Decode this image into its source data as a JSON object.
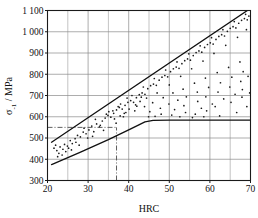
{
  "chart_data": {
    "type": "scatter",
    "title": "",
    "subtitle": "",
    "xlabel": "HRC",
    "ylabel": "σ₋₁ / MPa",
    "ylabel_parts": {
      "symbol": "σ",
      "subscript": "-1",
      "separator": " / ",
      "unit": "MPa"
    },
    "xlim": [
      20,
      70
    ],
    "ylim": [
      300,
      1100
    ],
    "grid": true,
    "grid_major_x": [
      20,
      30,
      40,
      50,
      60,
      70
    ],
    "grid_minor_x": [
      25,
      35,
      45,
      55,
      65
    ],
    "grid_major_y": [
      300,
      400,
      500,
      600,
      700,
      800,
      900,
      1000,
      1100
    ],
    "legend": null,
    "legend_position": "none",
    "xticks": [
      20,
      30,
      40,
      50,
      60,
      70
    ],
    "xtick_labels": [
      "20",
      "30",
      "40",
      "50",
      "60",
      "70"
    ],
    "yticks": [
      300,
      400,
      500,
      600,
      700,
      800,
      900,
      1000,
      1100
    ],
    "ytick_labels": [
      "300",
      "400",
      "500",
      "600",
      "700",
      "800",
      "900",
      "1 000",
      "1 100"
    ],
    "series": [
      {
        "name": "upper-bound",
        "type": "line",
        "style": "solid",
        "color": "#111111",
        "points": [
          [
            21,
            480
          ],
          [
            70,
            1110
          ]
        ]
      },
      {
        "name": "lower-bound",
        "type": "line",
        "style": "solid",
        "color": "#111111",
        "points": [
          [
            21,
            375
          ],
          [
            28,
            432
          ],
          [
            35,
            492
          ],
          [
            40,
            538
          ],
          [
            42.5,
            562
          ],
          [
            44,
            576
          ],
          [
            46,
            583
          ],
          [
            50,
            584
          ],
          [
            60,
            584
          ],
          [
            70,
            584
          ]
        ]
      },
      {
        "name": "scatter-band",
        "type": "scatter",
        "color": "#1b1b1b",
        "marker": "dot",
        "points": [
          [
            21.6,
            452
          ],
          [
            22.3,
            441
          ],
          [
            22.0,
            466
          ],
          [
            23.1,
            458
          ],
          [
            23.8,
            447
          ],
          [
            22.8,
            428
          ],
          [
            24.2,
            470
          ],
          [
            24.9,
            462
          ],
          [
            25.6,
            488
          ],
          [
            26.1,
            474
          ],
          [
            26.8,
            497
          ],
          [
            24.5,
            436
          ],
          [
            25.2,
            452
          ],
          [
            27.4,
            512
          ],
          [
            28.1,
            505
          ],
          [
            27.0,
            480
          ],
          [
            28.8,
            528
          ],
          [
            29.5,
            520
          ],
          [
            29.0,
            546
          ],
          [
            30.2,
            538
          ],
          [
            30.9,
            556
          ],
          [
            31.4,
            530
          ],
          [
            32.1,
            566
          ],
          [
            32.8,
            552
          ],
          [
            31.8,
            588
          ],
          [
            33.5,
            580
          ],
          [
            34.2,
            594
          ],
          [
            33.0,
            560
          ],
          [
            34.9,
            606
          ],
          [
            35.6,
            598
          ],
          [
            35.1,
            624
          ],
          [
            36.3,
            616
          ],
          [
            37.0,
            632
          ],
          [
            36.5,
            590
          ],
          [
            37.7,
            644
          ],
          [
            38.4,
            636
          ],
          [
            38.0,
            660
          ],
          [
            39.1,
            654
          ],
          [
            39.8,
            668
          ],
          [
            39.3,
            620
          ],
          [
            40.5,
            676
          ],
          [
            41.2,
            668
          ],
          [
            40.8,
            700
          ],
          [
            41.9,
            690
          ],
          [
            42.6,
            704
          ],
          [
            42.0,
            650
          ],
          [
            43.3,
            712
          ],
          [
            44.0,
            706
          ],
          [
            43.6,
            740
          ],
          [
            44.7,
            732
          ],
          [
            45.4,
            746
          ],
          [
            44.4,
            688
          ],
          [
            46.1,
            754
          ],
          [
            46.8,
            748
          ],
          [
            46.3,
            780
          ],
          [
            47.5,
            772
          ],
          [
            48.2,
            786
          ],
          [
            47.0,
            712
          ],
          [
            48.9,
            794
          ],
          [
            49.6,
            788
          ],
          [
            49.1,
            820
          ],
          [
            50.3,
            812
          ],
          [
            51.0,
            826
          ],
          [
            50.0,
            750
          ],
          [
            51.7,
            834
          ],
          [
            52.4,
            828
          ],
          [
            51.9,
            858
          ],
          [
            53.1,
            850
          ],
          [
            53.8,
            864
          ],
          [
            52.8,
            790
          ],
          [
            54.5,
            872
          ],
          [
            55.2,
            866
          ],
          [
            54.8,
            896
          ],
          [
            55.9,
            888
          ],
          [
            56.6,
            902
          ],
          [
            55.5,
            826
          ],
          [
            57.3,
            910
          ],
          [
            58.0,
            904
          ],
          [
            57.6,
            934
          ],
          [
            58.7,
            926
          ],
          [
            59.4,
            940
          ],
          [
            58.3,
            862
          ],
          [
            60.1,
            948
          ],
          [
            60.8,
            942
          ],
          [
            60.4,
            972
          ],
          [
            61.5,
            964
          ],
          [
            62.2,
            978
          ],
          [
            61.0,
            898
          ],
          [
            62.9,
            986
          ],
          [
            63.6,
            980
          ],
          [
            63.2,
            1010
          ],
          [
            64.3,
            1002
          ],
          [
            65.0,
            1016
          ],
          [
            63.9,
            936
          ],
          [
            65.7,
            1024
          ],
          [
            66.4,
            1018
          ],
          [
            66.0,
            1048
          ],
          [
            67.1,
            1040
          ],
          [
            67.8,
            1054
          ],
          [
            66.8,
            974
          ],
          [
            68.5,
            1062
          ],
          [
            69.2,
            1056
          ],
          [
            68.8,
            1082
          ],
          [
            69.6,
            1074
          ],
          [
            69.0,
            1010
          ],
          [
            22.5,
            412
          ],
          [
            23.6,
            420
          ],
          [
            25.9,
            444
          ],
          [
            27.8,
            466
          ],
          [
            29.9,
            500
          ],
          [
            31.1,
            508
          ],
          [
            33.8,
            536
          ],
          [
            36.9,
            570
          ],
          [
            38.7,
            600
          ],
          [
            41.5,
            628
          ],
          [
            43.9,
            648
          ],
          [
            45.9,
            666
          ],
          [
            48.5,
            690
          ],
          [
            50.9,
            712
          ],
          [
            53.4,
            730
          ],
          [
            56.2,
            758
          ],
          [
            58.9,
            782
          ],
          [
            61.8,
            808
          ],
          [
            64.6,
            832
          ],
          [
            67.4,
            858
          ],
          [
            45.2,
            624
          ],
          [
            47.8,
            640
          ],
          [
            49.9,
            660
          ],
          [
            52.1,
            678
          ],
          [
            54.2,
            694
          ],
          [
            56.9,
            716
          ],
          [
            59.7,
            738
          ],
          [
            62.6,
            760
          ],
          [
            65.4,
            786
          ],
          [
            68.2,
            812
          ],
          [
            46.5,
            602
          ],
          [
            48.0,
            612
          ],
          [
            51.3,
            634
          ],
          [
            53.6,
            652
          ],
          [
            57.0,
            672
          ],
          [
            59.0,
            694
          ],
          [
            62.0,
            716
          ],
          [
            64.9,
            740
          ],
          [
            67.6,
            766
          ],
          [
            69.4,
            790
          ],
          [
            50.6,
            608
          ],
          [
            54.0,
            620
          ],
          [
            57.9,
            640
          ],
          [
            60.6,
            660
          ],
          [
            63.4,
            684
          ],
          [
            66.2,
            706
          ],
          [
            68.0,
            728
          ],
          [
            52.6,
            600
          ],
          [
            56.4,
            612
          ],
          [
            59.2,
            628
          ],
          [
            61.3,
            648
          ],
          [
            65.2,
            668
          ],
          [
            67.9,
            692
          ],
          [
            69.8,
            712
          ],
          [
            44.9,
            600
          ],
          [
            58.5,
            600
          ],
          [
            62.4,
            604
          ],
          [
            66.6,
            620
          ],
          [
            69.1,
            648
          ],
          [
            55.7,
            596
          ],
          [
            34.5,
            612
          ],
          [
            36.1,
            628
          ],
          [
            37.4,
            648
          ],
          [
            38.9,
            616
          ],
          [
            40.1,
            636
          ],
          [
            42.8,
            672
          ],
          [
            39.6,
            688
          ],
          [
            41.7,
            656
          ],
          [
            43.1,
            692
          ],
          [
            37.9,
            604
          ]
        ]
      },
      {
        "name": "reference-horizontal",
        "type": "line",
        "style": "dash-dot",
        "color": "#4d4d4d",
        "value": 550,
        "points": [
          [
            20,
            550
          ],
          [
            37,
            550
          ]
        ]
      },
      {
        "name": "reference-vertical",
        "type": "line",
        "style": "dash-dot",
        "color": "#4d4d4d",
        "value": 37,
        "points": [
          [
            37,
            300
          ],
          [
            37,
            550
          ]
        ]
      }
    ],
    "annotations": []
  },
  "figure": {
    "background_color": "#ffffff",
    "axis_color": "#1a1a1a",
    "grid_color": "#8a8a8a",
    "data_color": "#111111",
    "reference_color": "#4d4d4d"
  }
}
